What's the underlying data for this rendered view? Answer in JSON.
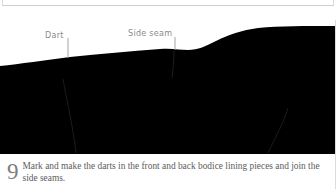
{
  "panel": {
    "figure": {
      "annotations": [
        {
          "id": "dart",
          "label": "Dart"
        },
        {
          "id": "side-seam",
          "label": "Side seam"
        }
      ],
      "subject": "dark bodice lining fabric silhouette",
      "background_color": "#ffffff",
      "silhouette_color": "#000000",
      "annotation_color": "#8a8a8a"
    },
    "caption": {
      "step_number": "9",
      "text": "Mark and make the darts in the front and back bodice lining pieces and join the side seams.",
      "number_color": "#7d7d7d",
      "text_color": "#5d5d5d"
    }
  },
  "chrome": {
    "border_color": "#dcdcdc"
  }
}
